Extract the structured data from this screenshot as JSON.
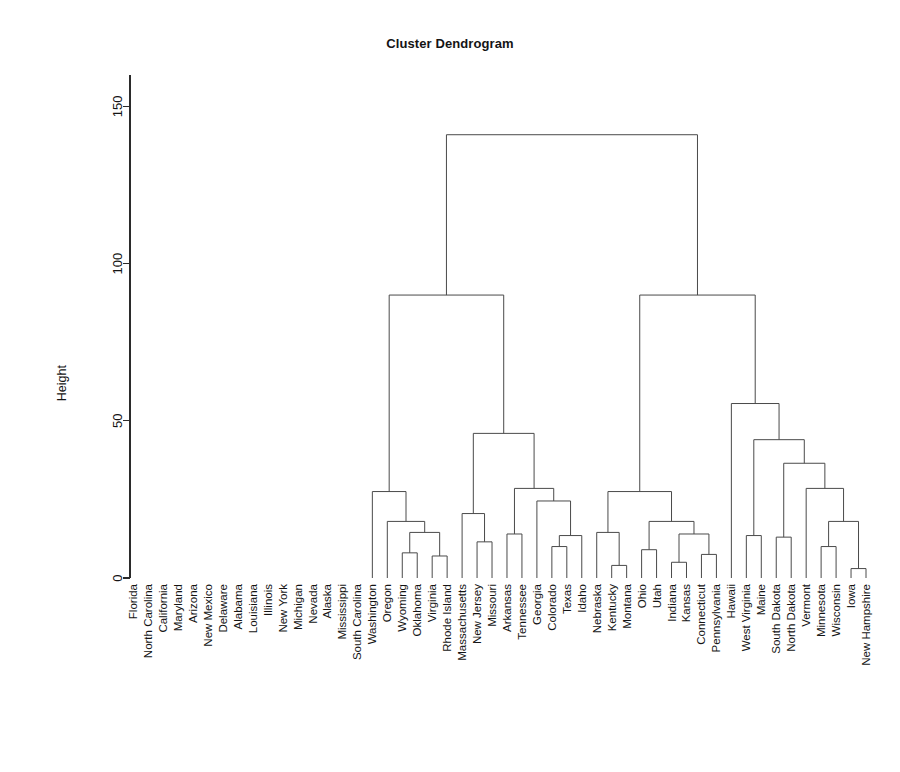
{
  "chart_data": {
    "type": "dendrogram",
    "title": "Cluster Dendrogram",
    "xlabel": "",
    "ylabel": "Height",
    "ylim": [
      0,
      160
    ],
    "yticks": [
      0,
      50,
      100,
      150
    ],
    "ytick_labels": [
      "0",
      "50",
      "100",
      "150"
    ],
    "grid": false,
    "legend": "none",
    "leaf_order": [
      "Florida",
      "North Carolina",
      "California",
      "Maryland",
      "Arizona",
      "New Mexico",
      "Delaware",
      "Alabama",
      "Louisiana",
      "Illinois",
      "New York",
      "Michigan",
      "Nevada",
      "Alaska",
      "Mississippi",
      "South Carolina",
      "Washington",
      "Oregon",
      "Wyoming",
      "Oklahoma",
      "Virginia",
      "Rhode Island",
      "Massachusetts",
      "New Jersey",
      "Missouri",
      "Arkansas",
      "Tennessee",
      "Georgia",
      "Colorado",
      "Texas",
      "Idaho",
      "Nebraska",
      "Kentucky",
      "Montana",
      "Ohio",
      "Utah",
      "Indiana",
      "Kansas",
      "Connecticut",
      "Pennsylvania",
      "Hawaii",
      "West Virginia",
      "Maine",
      "South Dakota",
      "North Dakota",
      "Vermont",
      "Minnesota",
      "Wisconsin",
      "Iowa",
      "New Hampshire"
    ],
    "merges": [
      {
        "id": "m1",
        "left": {
          "leaf": 0
        },
        "right": {
          "leaf": 1
        },
        "height": 38.5
      },
      {
        "id": "m2",
        "left": {
          "node": "m1"
        },
        "right": {
          "leaf": 2
        },
        "height": 79.0
      },
      {
        "id": "m3",
        "left": {
          "leaf": 4
        },
        "right": {
          "leaf": 5
        },
        "height": 14.5
      },
      {
        "id": "m4",
        "left": {
          "leaf": 3
        },
        "right": {
          "node": "m3"
        },
        "height": 28.0
      },
      {
        "id": "m5",
        "left": {
          "leaf": 7
        },
        "right": {
          "leaf": 8
        },
        "height": 15.5
      },
      {
        "id": "m6",
        "left": {
          "leaf": 6
        },
        "right": {
          "node": "m5"
        },
        "height": 17.0
      },
      {
        "id": "m7",
        "left": {
          "leaf": 9
        },
        "right": {
          "leaf": 10
        },
        "height": 5.5
      },
      {
        "id": "m8",
        "left": {
          "leaf": 11
        },
        "right": {
          "leaf": 12
        },
        "height": 13.0
      },
      {
        "id": "m9",
        "left": {
          "node": "m7"
        },
        "right": {
          "node": "m8"
        },
        "height": 18.5
      },
      {
        "id": "m10",
        "left": {
          "node": "m6"
        },
        "right": {
          "node": "m9"
        },
        "height": 23.5
      },
      {
        "id": "m11",
        "left": {
          "node": "m4"
        },
        "right": {
          "node": "m10"
        },
        "height": 36.0
      },
      {
        "id": "m12",
        "left": {
          "leaf": 14
        },
        "right": {
          "leaf": 15
        },
        "height": 21.5
      },
      {
        "id": "m13",
        "left": {
          "leaf": 13
        },
        "right": {
          "node": "m12"
        },
        "height": 28.0
      },
      {
        "id": "m14",
        "left": {
          "node": "m11"
        },
        "right": {
          "node": "m13"
        },
        "height": 45.5
      },
      {
        "id": "m15",
        "left": {
          "node": "m2"
        },
        "right": {
          "node": "m14"
        },
        "height": 79.0
      },
      {
        "id": "m16",
        "left": {
          "leaf": 18
        },
        "right": {
          "leaf": 19
        },
        "height": 8.0
      },
      {
        "id": "m17",
        "left": {
          "leaf": 20
        },
        "right": {
          "leaf": 21
        },
        "height": 7.0
      },
      {
        "id": "m18",
        "left": {
          "node": "m16"
        },
        "right": {
          "node": "m17"
        },
        "height": 14.5
      },
      {
        "id": "m19",
        "left": {
          "leaf": 17
        },
        "right": {
          "node": "m18"
        },
        "height": 18.0
      },
      {
        "id": "m20",
        "left": {
          "leaf": 16
        },
        "right": {
          "node": "m19"
        },
        "height": 27.5
      },
      {
        "id": "m21",
        "left": {
          "leaf": 23
        },
        "right": {
          "leaf": 24
        },
        "height": 11.5
      },
      {
        "id": "m22",
        "left": {
          "leaf": 22
        },
        "right": {
          "node": "m21"
        },
        "height": 20.5
      },
      {
        "id": "m23",
        "left": {
          "leaf": 25
        },
        "right": {
          "leaf": 26
        },
        "height": 14.0
      },
      {
        "id": "m24",
        "left": {
          "leaf": 28
        },
        "right": {
          "leaf": 29
        },
        "height": 10.0
      },
      {
        "id": "m25",
        "left": {
          "node": "m24"
        },
        "right": {
          "leaf": 30
        },
        "height": 13.5
      },
      {
        "id": "m26",
        "left": {
          "leaf": 27
        },
        "right": {
          "node": "m25"
        },
        "height": 24.5
      },
      {
        "id": "m27",
        "left": {
          "node": "m23"
        },
        "right": {
          "node": "m26"
        },
        "height": 28.5
      },
      {
        "id": "m28",
        "left": {
          "node": "m22"
        },
        "right": {
          "node": "m27"
        },
        "height": 46.0
      },
      {
        "id": "m29",
        "left": {
          "node": "m20"
        },
        "right": {
          "node": "m28"
        },
        "height": 90.0
      },
      {
        "id": "m30",
        "left": {
          "leaf": 32
        },
        "right": {
          "leaf": 33
        },
        "height": 4.0
      },
      {
        "id": "m31",
        "left": {
          "node": "m30"
        },
        "right": {
          "leaf": 31
        },
        "height": 14.5
      },
      {
        "id": "m32",
        "left": {
          "leaf": 34
        },
        "right": {
          "leaf": 35
        },
        "height": 9.0
      },
      {
        "id": "m33",
        "left": {
          "leaf": 36
        },
        "right": {
          "leaf": 37
        },
        "height": 5.0
      },
      {
        "id": "m34",
        "left": {
          "leaf": 38
        },
        "right": {
          "leaf": 39
        },
        "height": 7.5
      },
      {
        "id": "m35",
        "left": {
          "node": "m33"
        },
        "right": {
          "node": "m34"
        },
        "height": 14.0
      },
      {
        "id": "m36",
        "left": {
          "node": "m32"
        },
        "right": {
          "node": "m35"
        },
        "height": 18.0
      },
      {
        "id": "m37",
        "left": {
          "node": "m31"
        },
        "right": {
          "node": "m36"
        },
        "height": 27.5
      },
      {
        "id": "m38",
        "left": {
          "leaf": 41
        },
        "right": {
          "leaf": 42
        },
        "height": 13.5
      },
      {
        "id": "m39",
        "left": {
          "leaf": 43
        },
        "right": {
          "leaf": 44
        },
        "height": 13.0
      },
      {
        "id": "m40",
        "left": {
          "leaf": 46
        },
        "right": {
          "leaf": 47
        },
        "height": 10.0
      },
      {
        "id": "m41",
        "left": {
          "leaf": 48
        },
        "right": {
          "leaf": 49
        },
        "height": 3.0
      },
      {
        "id": "m42",
        "left": {
          "node": "m40"
        },
        "right": {
          "node": "m41"
        },
        "height": 18.0
      },
      {
        "id": "m43",
        "left": {
          "leaf": 45
        },
        "right": {
          "node": "m42"
        },
        "height": 28.5
      },
      {
        "id": "m44",
        "left": {
          "node": "m39"
        },
        "right": {
          "node": "m43"
        },
        "height": 36.5
      },
      {
        "id": "m45",
        "left": {
          "node": "m38"
        },
        "right": {
          "node": "m44"
        },
        "height": 44.0
      },
      {
        "id": "m46",
        "left": {
          "leaf": 40
        },
        "right": {
          "node": "m45"
        },
        "height": 55.5
      },
      {
        "id": "m47",
        "left": {
          "node": "m37"
        },
        "right": {
          "node": "m46"
        },
        "height": 90.0
      },
      {
        "id": "m48",
        "left": {
          "node": "m29"
        },
        "right": {
          "node": "m47"
        },
        "height": 141.0
      }
    ],
    "root": "m48"
  },
  "plot": {
    "title": "Cluster Dendrogram",
    "axis_title": "Height"
  }
}
